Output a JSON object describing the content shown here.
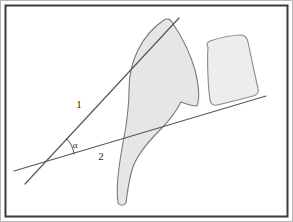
{
  "figure": {
    "kind": "angle-measurement-diagram",
    "background_color": "#ffffff",
    "frame": {
      "outer_border_color": "#b7b7b7",
      "inner_border_color": "#3a3a3a",
      "inner_border_width": 2
    },
    "labels": {
      "line_one": "1",
      "line_two": "2",
      "angle": "α"
    },
    "colors": {
      "stroke": "#585858",
      "shape_fill": "#e6e6e6",
      "shape_outline": "#7a7a7a",
      "rect_fill": "#ededed",
      "rect_outline": "#8a8a8a",
      "label_color": "#2b2b2b"
    },
    "geometry": {
      "line_one": {
        "x1": 25,
        "y1": 184,
        "x2": 179,
        "y2": 18
      },
      "line_two": {
        "x1": 14,
        "y1": 171,
        "x2": 266,
        "y2": 96
      },
      "vertex": {
        "x": 50,
        "y": 162
      },
      "angle_arc_radius": 26,
      "label_one_pos": {
        "x": 79,
        "y": 108
      },
      "label_two_pos": {
        "x": 101,
        "y": 160
      },
      "label_alpha_pos": {
        "x": 75,
        "y": 148
      }
    },
    "shapes": [
      {
        "name": "bone-silhouette",
        "fill": "#e6e6e6",
        "outline": "#7a7a7a",
        "path": "M 172 22 C 180 34 190 52 195 70 C 199 86 200 98 197 106 C 192 106 186 104 181 102 C 176 112 168 122 159 131 C 146 144 136 156 132 170 C 128 184 127 196 126 203 C 124 206 120 206 118 203 C 117 195 117 182 119 168 C 121 152 124 138 126 126 C 128 112 129 100 129 90 C 129 76 132 62 138 50 C 145 36 155 26 164 20 C 167 18 170 19 172 22 Z"
      },
      {
        "name": "vertebral-body-rect",
        "fill": "#ededed",
        "outline": "#8a8a8a",
        "path": "M 208 47 C 206 45 207 42 210 41 C 222 37 235 35 241 35 C 245 35 247 38 248 42 C 251 56 255 76 258 88 C 259 92 257 95 253 96 C 242 99 226 103 217 105 C 213 106 211 104 210 100 C 208 86 207 62 208 47 Z"
      }
    ]
  }
}
